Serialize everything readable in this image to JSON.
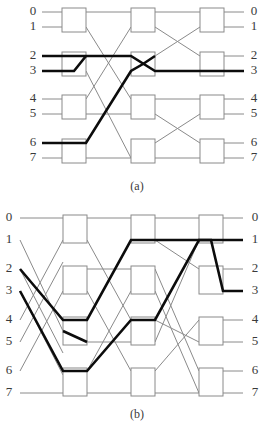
{
  "figure": {
    "colors": {
      "wire": "#8a8a8a",
      "route": "#0c0c0c",
      "switch_stroke": "#8a8a8a",
      "switch_fill": "#ffffff",
      "label_text": "#3a3a3a",
      "background": "#ffffff"
    },
    "panels": [
      {
        "id": "a",
        "caption": "(a)",
        "stages": 3,
        "switches_per_stage": 4,
        "input_labels": [
          "0",
          "1",
          "2",
          "3",
          "4",
          "5",
          "6",
          "7"
        ],
        "output_labels": [
          "0",
          "1",
          "2",
          "3",
          "4",
          "5",
          "6",
          "7"
        ],
        "highlighted_routes": [
          {
            "name": "route-2-to-3",
            "from": "2",
            "to": "3"
          },
          {
            "name": "route-6-to-2",
            "from": "6",
            "to": "2"
          }
        ]
      },
      {
        "id": "b",
        "caption": "(b)",
        "stages": 3,
        "switches_per_stage": 4,
        "input_labels": [
          "0",
          "1",
          "2",
          "3",
          "4",
          "5",
          "6",
          "7"
        ],
        "output_labels": [
          "0",
          "1",
          "2",
          "3",
          "4",
          "5",
          "6",
          "7"
        ],
        "highlighted_routes": [
          {
            "name": "route-2-to-1",
            "from": "2",
            "to": "1"
          },
          {
            "name": "route-3-to-3",
            "from": "3",
            "to": "3"
          }
        ]
      }
    ]
  }
}
